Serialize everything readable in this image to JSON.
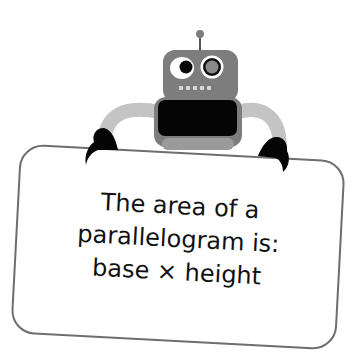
{
  "illustration": {
    "subject": "robot holding a sign",
    "colors": {
      "robot_body": "#7d7d7d",
      "robot_arm": "#c2c2c2",
      "screen": "#050505",
      "sign_border": "#6e6e6e",
      "text": "#111111"
    }
  },
  "sign": {
    "lines": [
      "The area of a",
      "parallelogram is:",
      "base × height"
    ]
  }
}
